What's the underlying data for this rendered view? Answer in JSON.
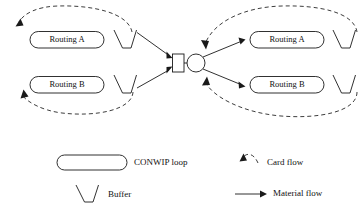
{
  "figure": {
    "type": "conwip-routing-diagram",
    "background_color": "#ffffff",
    "stroke_color": "#1a1a1a"
  },
  "left_section": {
    "routings": [
      {
        "label": "Routing A"
      },
      {
        "label": "Routing B"
      }
    ],
    "buffers": [
      {
        "name": "buffer-left-a"
      },
      {
        "name": "buffer-left-b"
      }
    ]
  },
  "center_section": {
    "machine": {
      "name": "machine-square"
    },
    "station": {
      "name": "station-circle"
    }
  },
  "right_section": {
    "routings": [
      {
        "label": "Routing A"
      },
      {
        "label": "Routing B"
      }
    ],
    "buffers": [
      {
        "name": "buffer-right-a"
      },
      {
        "name": "buffer-right-b"
      }
    ]
  },
  "legend": {
    "items": [
      {
        "key": "conwip-loop",
        "label": "CONWIP loop",
        "symbol": "rounded-rectangle"
      },
      {
        "key": "card-flow",
        "label": "Card flow",
        "symbol": "dashed-arrow"
      },
      {
        "key": "buffer",
        "label": "Buffer",
        "symbol": "trapezoid"
      },
      {
        "key": "material-flow",
        "label": "Material flow",
        "symbol": "solid-arrow"
      }
    ]
  }
}
